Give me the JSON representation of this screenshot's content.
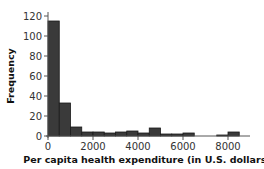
{
  "chart_data": {
    "type": "bar",
    "title": "",
    "xlabel": "Per capita health expenditure (in U.S. dollars)",
    "ylabel": "Frequency",
    "bin_width": 500,
    "bins": [
      {
        "start": 0,
        "end": 500,
        "value": 115
      },
      {
        "start": 500,
        "end": 1000,
        "value": 33
      },
      {
        "start": 1000,
        "end": 1500,
        "value": 9
      },
      {
        "start": 1500,
        "end": 2000,
        "value": 4
      },
      {
        "start": 2000,
        "end": 2500,
        "value": 4
      },
      {
        "start": 2500,
        "end": 3000,
        "value": 3
      },
      {
        "start": 3000,
        "end": 3500,
        "value": 4
      },
      {
        "start": 3500,
        "end": 4000,
        "value": 5
      },
      {
        "start": 4000,
        "end": 4500,
        "value": 3
      },
      {
        "start": 4500,
        "end": 5000,
        "value": 8
      },
      {
        "start": 5000,
        "end": 5500,
        "value": 2
      },
      {
        "start": 5500,
        "end": 6000,
        "value": 2
      },
      {
        "start": 6000,
        "end": 6500,
        "value": 3
      },
      {
        "start": 6500,
        "end": 7000,
        "value": 0
      },
      {
        "start": 7000,
        "end": 7500,
        "value": 0
      },
      {
        "start": 7500,
        "end": 8000,
        "value": 1
      },
      {
        "start": 8000,
        "end": 8500,
        "value": 4
      }
    ],
    "x_ticks": [
      0,
      2000,
      4000,
      6000,
      8000
    ],
    "y_ticks": [
      0,
      20,
      40,
      60,
      80,
      100,
      120
    ],
    "xlim": [
      0,
      9000
    ],
    "ylim": [
      0,
      125
    ],
    "grid": false,
    "legend": null,
    "bar_color": "#3a3a3a"
  }
}
